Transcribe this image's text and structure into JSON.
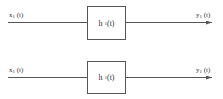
{
  "systems": [
    {
      "input": {
        "var": "x",
        "sub": "1",
        "arg": "(t)"
      },
      "block": {
        "var": "h",
        "sub": "1",
        "arg": "(t)"
      },
      "output": {
        "var": "y",
        "sub": "1",
        "arg": "(t)"
      }
    },
    {
      "input": {
        "var": "x",
        "sub": "1",
        "arg": "(t)"
      },
      "block": {
        "var": "h",
        "sub": "1",
        "arg": "(t)"
      },
      "output": {
        "var": "y",
        "sub": "1",
        "arg": "(t)"
      }
    }
  ],
  "colors": {
    "line": "#555555",
    "text": "#333333"
  }
}
